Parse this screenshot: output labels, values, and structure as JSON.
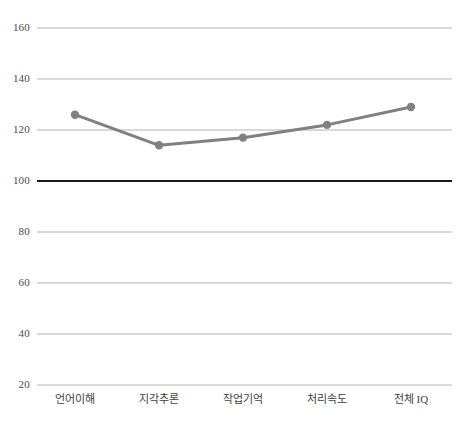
{
  "chart_data": {
    "type": "line",
    "title": "",
    "subtitle": "",
    "xlabel": "",
    "ylabel": "",
    "categories": [
      "언어이해",
      "지각추론",
      "작업기억",
      "처리속도",
      "전체 IQ"
    ],
    "series": [
      {
        "name": "",
        "values": [
          126,
          114,
          117,
          122,
          129
        ],
        "color": "#808080",
        "marker": "circle"
      }
    ],
    "ylim": [
      20,
      160
    ],
    "yticks": [
      20,
      40,
      60,
      80,
      100,
      120,
      140,
      160
    ],
    "ytick_labels": [
      "20",
      "40",
      "60",
      "80",
      "100",
      "120",
      "140",
      "160"
    ],
    "grid": true,
    "grid_color": "#b3b3b3",
    "reference_line": {
      "value": 100,
      "color": "#1a1a1a",
      "width": 2
    },
    "legend": null,
    "legend_position": "none",
    "annotations": []
  },
  "axes": {
    "y_axis_name": "standard-score-axis",
    "x_axis_name": "index-category-axis"
  }
}
